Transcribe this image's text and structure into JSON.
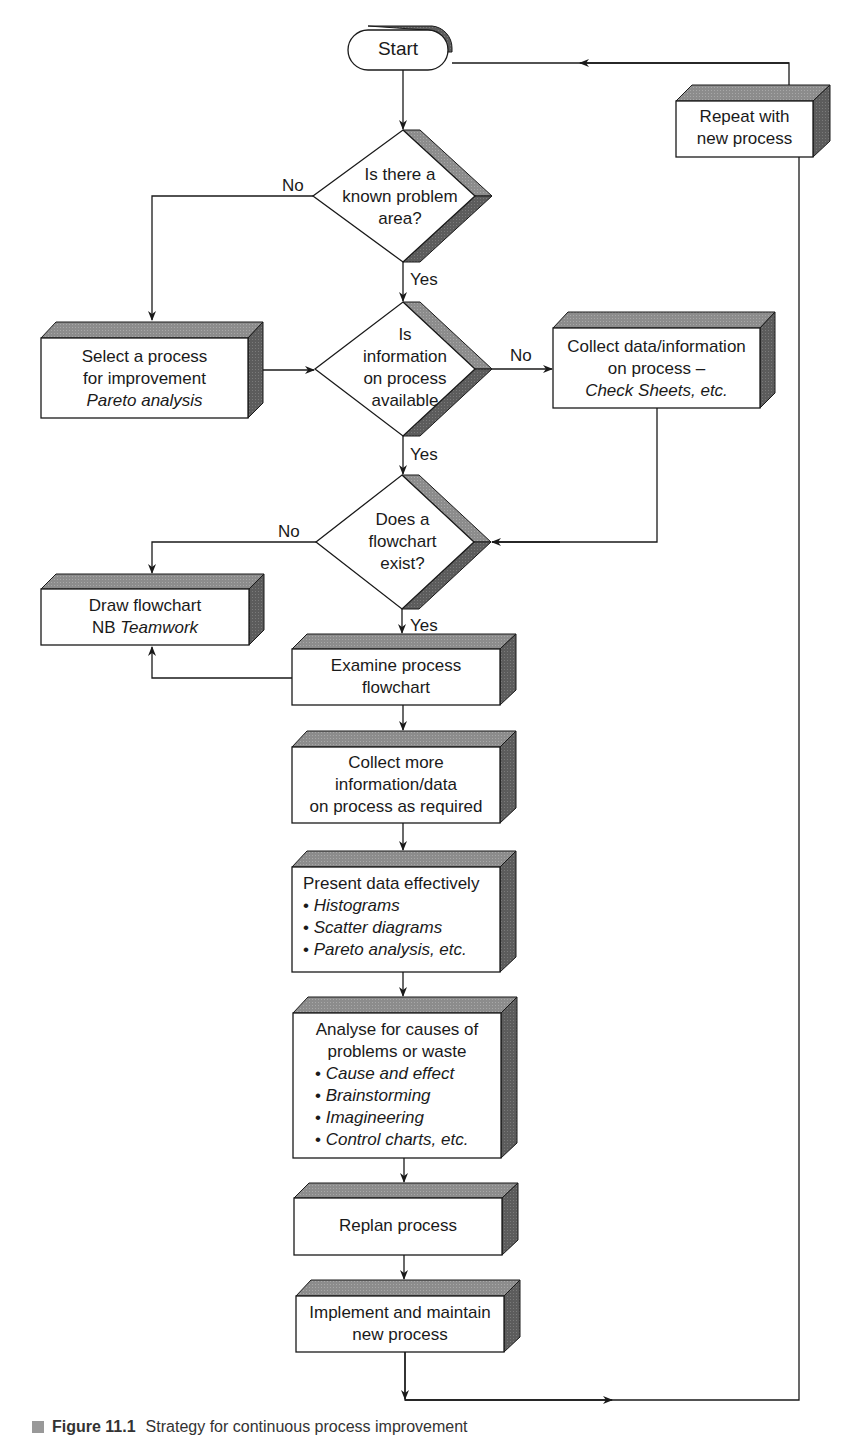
{
  "figure": {
    "caption_label": "Figure 11.1",
    "caption_text": "Strategy for continuous process improvement"
  },
  "colors": {
    "line": "#1a1a1a",
    "shade_top": "#8c8c8c",
    "shade_side": "#5a5a5a",
    "face": "#ffffff"
  },
  "nodes": {
    "start": {
      "label": "Start"
    },
    "repeat": {
      "lines": [
        "Repeat with",
        "new process"
      ]
    },
    "decision_known_problem": {
      "lines": [
        "Is there a",
        "known problem",
        "area?"
      ]
    },
    "select_process": {
      "lines": [
        "Select a process",
        "for improvement"
      ],
      "italic": "Pareto analysis"
    },
    "decision_info_available": {
      "lines": [
        "Is",
        "information",
        "on process",
        "available"
      ]
    },
    "collect_data": {
      "lines": [
        "Collect data/information",
        "on process –"
      ],
      "italic": "Check Sheets",
      "suffix": ", etc."
    },
    "decision_flowchart_exists": {
      "lines": [
        "Does a",
        "flowchart",
        "exist?"
      ]
    },
    "draw_flowchart": {
      "line1": "Draw flowchart",
      "prefix": "NB ",
      "italic": "Teamwork"
    },
    "examine_flowchart": {
      "lines": [
        "Examine process",
        "flowchart"
      ]
    },
    "collect_more": {
      "lines": [
        "Collect more",
        "information/data",
        "on process as required"
      ]
    },
    "present_data": {
      "title": "Present data effectively",
      "bullets": [
        "Histograms",
        "Scatter diagrams",
        "Pareto analysis, etc."
      ]
    },
    "analyse": {
      "title_lines": [
        "Analyse for causes of",
        "problems or waste"
      ],
      "bullets": [
        "Cause and effect",
        "Brainstorming",
        "Imagineering",
        "Control charts, etc."
      ]
    },
    "replan": {
      "label": "Replan process"
    },
    "implement": {
      "lines": [
        "Implement and maintain",
        "new process"
      ]
    }
  },
  "edge_labels": {
    "no": "No",
    "yes": "Yes",
    "bullet": "•"
  }
}
